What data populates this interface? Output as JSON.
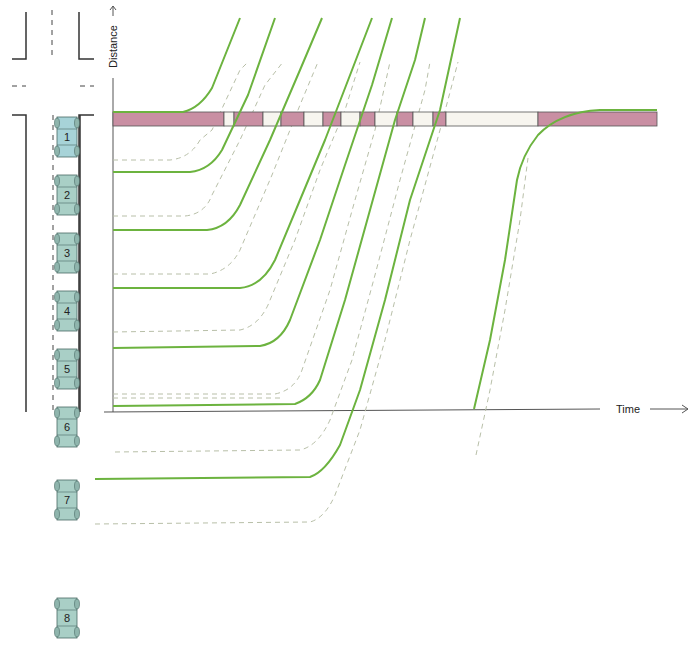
{
  "axes": {
    "y_label": "Distance",
    "x_label": "Time",
    "origin": [
      113,
      412
    ],
    "y_top": 5,
    "x_right": 690
  },
  "colors": {
    "trajectory": "#6cb33f",
    "follow_dash": "#b8bfa8",
    "signal_red": "#c98fa3",
    "signal_green_phase": "#f7f5ef",
    "car_fill": "#a9cfc6",
    "car_first_fill": "#a7d3d8",
    "road_line": "#333333"
  },
  "signal_bar": {
    "y": 112,
    "height": 14,
    "segments": [
      {
        "x0": 113,
        "x1": 224,
        "state": "red"
      },
      {
        "x0": 224,
        "x1": 234,
        "state": "green"
      },
      {
        "x0": 234,
        "x1": 263,
        "state": "red"
      },
      {
        "x0": 263,
        "x1": 281,
        "state": "green"
      },
      {
        "x0": 281,
        "x1": 304,
        "state": "red"
      },
      {
        "x0": 304,
        "x1": 323,
        "state": "green"
      },
      {
        "x0": 323,
        "x1": 341,
        "state": "red"
      },
      {
        "x0": 341,
        "x1": 360,
        "state": "green"
      },
      {
        "x0": 360,
        "x1": 375,
        "state": "red"
      },
      {
        "x0": 375,
        "x1": 397,
        "state": "green"
      },
      {
        "x0": 397,
        "x1": 413,
        "state": "red"
      },
      {
        "x0": 413,
        "x1": 433,
        "state": "green"
      },
      {
        "x0": 433,
        "x1": 446,
        "state": "red"
      },
      {
        "x0": 446,
        "x1": 538,
        "state": "green"
      },
      {
        "x0": 538,
        "x1": 657,
        "state": "red"
      }
    ]
  },
  "cars": [
    {
      "label": "1",
      "y": 117
    },
    {
      "label": "2",
      "y": 175
    },
    {
      "label": "3",
      "y": 233
    },
    {
      "label": "4",
      "y": 291
    },
    {
      "label": "5",
      "y": 349
    },
    {
      "label": "6",
      "y": 407
    },
    {
      "label": "7",
      "y": 480
    },
    {
      "label": "8",
      "y": 598
    }
  ],
  "trajectories": [
    "M113,112 L183,112 Q200,108 212,88 L240,18",
    "M113,172 L190,172 Q210,170 222,150 L248,95 L275,18",
    "M113,230 L207,230 Q228,228 240,205 L270,140 L300,70 L322,18",
    "M113,288 L240,288 Q262,286 275,260 L300,200 L325,140 L352,70 L372,18",
    "M113,348 L260,346 Q280,343 290,320 L320,240 L345,165 L372,85 L392,18",
    "M113,406 L295,404 Q312,398 320,380 L345,300 L370,210 L395,120 L415,60 L425,18",
    "M95,479 L310,477 Q325,472 340,445 L360,390 L385,300 L410,200 L440,110 L460,18",
    "M474,409 L490,340 L505,260 L517,180 Q522,155 538,135 Q560,112 600,110 L657,110"
  ],
  "follow_paths": [
    "M113,160 L170,160 Q190,158 200,140 L212,130 L240,70 L248,62",
    "M113,216 L185,216 Q205,214 212,195 L240,140 L265,85 L283,62",
    "M113,274 L210,274 Q230,270 240,250 L272,175 L300,105 L318,62",
    "M113,332 L240,330 Q258,326 268,305 L295,240 L320,170 L345,110 L360,62",
    "M113,394 L275,394 Q295,390 302,370 L330,290 L355,200 L375,130 L390,62",
    "M113,398 L280,398",
    "M115,452 L300,450 Q318,446 330,420 L352,360 L375,275 L400,180 L425,90 L430,62",
    "M95,524 L310,522 Q325,518 335,495 L360,430 L385,340 L410,240 L440,130 L458,62",
    "M476,455 L490,390 L505,310 L520,220 L528,158"
  ]
}
